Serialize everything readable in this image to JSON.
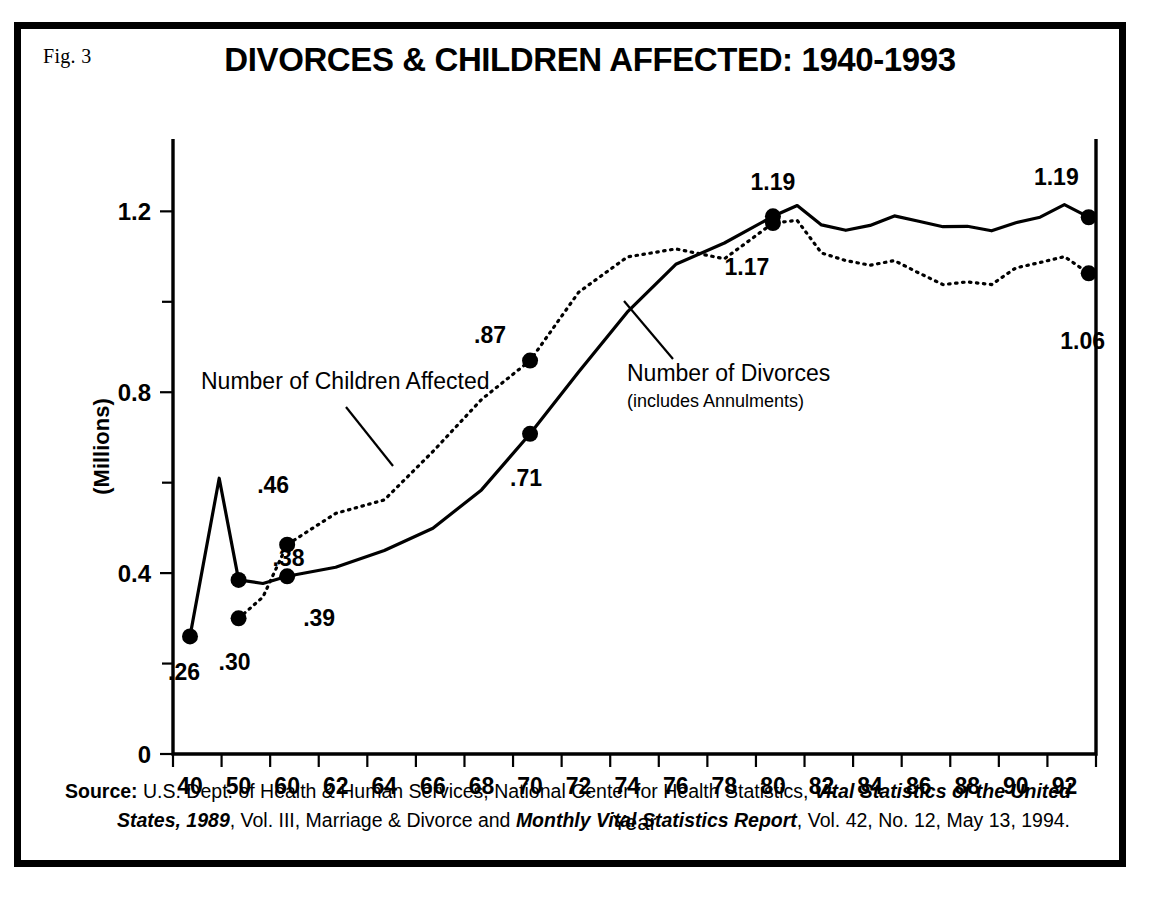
{
  "figure": {
    "fig_label": "Fig. 3",
    "title": "DIVORCES & CHILDREN AFFECTED: 1940-1993"
  },
  "source": {
    "head": "Source:",
    "line1_a": "U.S. Dept. of Health & Human Services, National Center for Health Statistics,",
    "line1_italic": "Vital Statistics of the United",
    "line2_italic_a": "States, 1989",
    "line2_b": ", Vol. III, Marriage & Divorce and",
    "line2_italic_b": "Monthly Vital Statistics Report",
    "line2_c": ", Vol. 42,  No. 12,  May 13, 1994."
  },
  "annotations": {
    "children_label": "Number of Children Affected",
    "divorces_label": "Number of Divorces",
    "divorces_sublabel": "(includes Annulments)"
  },
  "chart_data": {
    "type": "line",
    "title": "DIVORCES & CHILDREN AFFECTED: 1940-1993",
    "xlabel": "Year",
    "ylabel": "(Millions)",
    "xlim": [
      1939,
      1994
    ],
    "ylim": [
      0,
      1.36
    ],
    "ytick_labels": [
      "0",
      "0.4",
      "0.8",
      "1.2"
    ],
    "ytick_values": [
      0,
      0.4,
      0.8,
      1.2
    ],
    "yminor_values": [
      0.2,
      0.6,
      1.0
    ],
    "xtick_labels": [
      "40",
      "50",
      "60",
      "62",
      "64",
      "66",
      "68",
      "70",
      "72",
      "74",
      "76",
      "78",
      "80",
      "82",
      "84",
      "86",
      "88",
      "90",
      "92"
    ],
    "xtick_values": [
      1940,
      1950,
      1960,
      1962,
      1964,
      1966,
      1968,
      1970,
      1972,
      1974,
      1976,
      1978,
      1980,
      1982,
      1984,
      1986,
      1988,
      1990,
      1992
    ],
    "grid": false,
    "legend_position": "inline-annotations",
    "series": [
      {
        "name": "Number of Divorces (includes Annulments)",
        "style": "solid",
        "x": [
          1940,
          1946,
          1950,
          1955,
          1960,
          1962,
          1964,
          1966,
          1968,
          1970,
          1972,
          1974,
          1976,
          1978,
          1980,
          1981,
          1982,
          1983,
          1984,
          1985,
          1986,
          1987,
          1988,
          1989,
          1990,
          1991,
          1992,
          1993
        ],
        "values": [
          0.26,
          0.61,
          0.385,
          0.377,
          0.393,
          0.413,
          0.45,
          0.499,
          0.584,
          0.708,
          0.845,
          0.977,
          1.083,
          1.13,
          1.189,
          1.213,
          1.17,
          1.158,
          1.169,
          1.19,
          1.178,
          1.166,
          1.167,
          1.157,
          1.175,
          1.187,
          1.215,
          1.187
        ]
      },
      {
        "name": "Number of Children Affected",
        "style": "dotted",
        "x": [
          1950,
          1955,
          1960,
          1962,
          1964,
          1966,
          1968,
          1970,
          1972,
          1974,
          1976,
          1978,
          1980,
          1981,
          1982,
          1983,
          1984,
          1985,
          1986,
          1987,
          1988,
          1989,
          1990,
          1991,
          1992,
          1993
        ],
        "values": [
          0.3,
          0.347,
          0.463,
          0.532,
          0.562,
          0.669,
          0.784,
          0.87,
          1.021,
          1.099,
          1.117,
          1.095,
          1.174,
          1.18,
          1.108,
          1.091,
          1.081,
          1.091,
          1.064,
          1.038,
          1.044,
          1.038,
          1.075,
          1.087,
          1.1,
          1.063
        ]
      }
    ],
    "point_labels": [
      {
        "text": ".26",
        "series": "divorces",
        "x": 1940,
        "y": 0.26
      },
      {
        "text": ".38",
        "series": "divorces",
        "x": 1950,
        "y": 0.385
      },
      {
        "text": ".39",
        "series": "divorces",
        "x": 1960,
        "y": 0.393
      },
      {
        "text": ".71",
        "series": "divorces",
        "x": 1970,
        "y": 0.708
      },
      {
        "text": "1.19",
        "series": "divorces",
        "x": 1980,
        "y": 1.189
      },
      {
        "text": "1.19",
        "series": "divorces",
        "x": 1993,
        "y": 1.187
      },
      {
        "text": ".30",
        "series": "children",
        "x": 1950,
        "y": 0.3
      },
      {
        "text": ".46",
        "series": "children",
        "x": 1960,
        "y": 0.463
      },
      {
        "text": ".87",
        "series": "children",
        "x": 1970,
        "y": 0.87
      },
      {
        "text": "1.17",
        "series": "children",
        "x": 1980,
        "y": 1.174
      },
      {
        "text": "1.06",
        "series": "children",
        "x": 1993,
        "y": 1.063
      }
    ]
  }
}
